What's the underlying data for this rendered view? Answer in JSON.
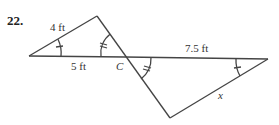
{
  "problem": {
    "number": "22.",
    "labels": {
      "left_upper_side": "4 ft",
      "left_base": "5 ft",
      "vertex": "C",
      "right_base": "7.5 ft",
      "right_lower_side": "x"
    }
  },
  "colors": {
    "stroke": "#444444",
    "text": "#333333"
  }
}
